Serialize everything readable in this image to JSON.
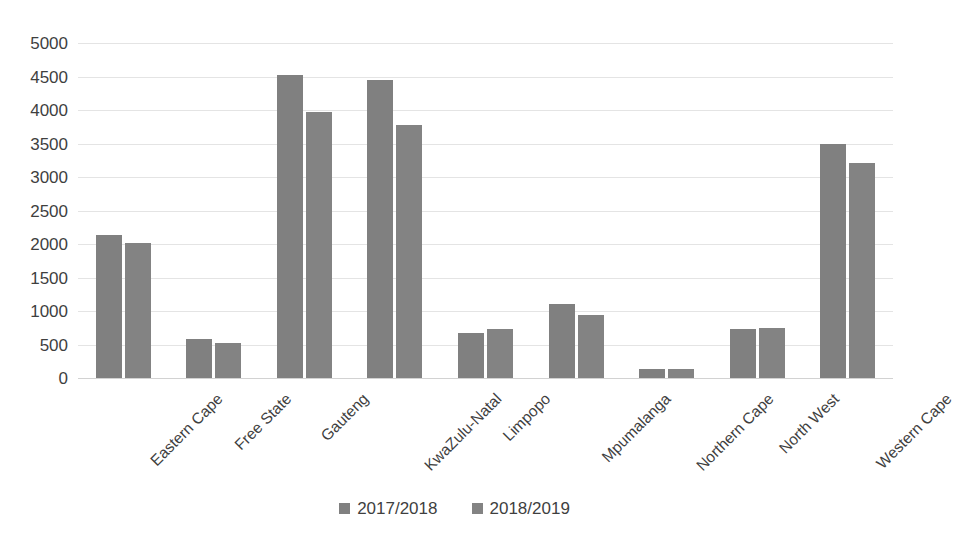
{
  "chart_data": {
    "type": "bar",
    "title": "",
    "subtitle": "",
    "xlabel": "",
    "ylabel": "",
    "ylim": [
      0,
      5000
    ],
    "ytick_step": 500,
    "yticks": [
      5000,
      4500,
      4000,
      3500,
      3000,
      2500,
      2000,
      1500,
      1000,
      500,
      0
    ],
    "grid": true,
    "legend_position": "bottom",
    "categories": [
      "Eastern Cape",
      "Free State",
      "Gauteng",
      "KwaZulu-Natal",
      "Limpopo",
      "Mpumalanga",
      "Northern Cape",
      "North West",
      "Western Cape"
    ],
    "series": [
      {
        "name": "2017/2018",
        "color": "#808080",
        "values": [
          2140,
          580,
          4520,
          4450,
          665,
          1110,
          140,
          730,
          3490
        ]
      },
      {
        "name": "2018/2019",
        "color": "#838383",
        "values": [
          2010,
          525,
          3970,
          3770,
          730,
          940,
          135,
          745,
          3210
        ]
      }
    ]
  }
}
